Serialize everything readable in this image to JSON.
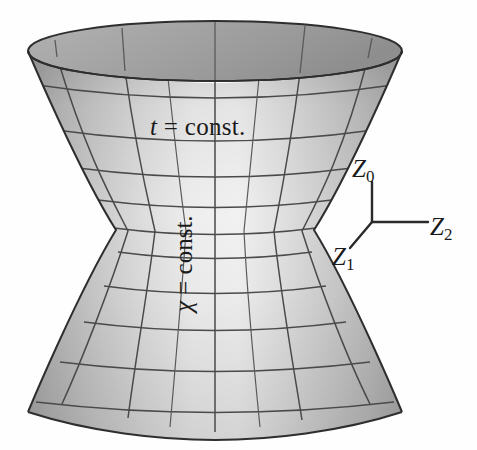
{
  "figure": {
    "kind": "hyperboloid-of-one-sheet",
    "background_color": "#fefefe",
    "outline_color": "#3a3a3a",
    "grid_color": "#4a4a4a",
    "surface_light": "#f0f0f0",
    "surface_mid": "#d2d2d2",
    "surface_dark": "#b4b4b4",
    "rim_interior_color": "#a4a4a4"
  },
  "labels": {
    "t_const": {
      "var": "t",
      "rel": " = const."
    },
    "chi_const": {
      "var": "χ",
      "rel": " = const."
    }
  },
  "axes": {
    "name": "coordinate-triad",
    "origin": {
      "x": 372,
      "y": 222
    },
    "arms": [
      {
        "name": "Z0",
        "letter": "Z",
        "sub": "0",
        "dir": "up",
        "tip": {
          "x": 372,
          "y": 182
        }
      },
      {
        "name": "Z2",
        "letter": "Z",
        "sub": "2",
        "dir": "right",
        "tip": {
          "x": 428,
          "y": 222
        }
      },
      {
        "name": "Z1",
        "letter": "Z",
        "sub": "1",
        "dir": "lower-left",
        "tip": {
          "x": 350,
          "y": 248
        }
      }
    ]
  },
  "geometry": {
    "center_x": 215,
    "waist_y": 230,
    "waist_half_width": 99,
    "top_y": 22,
    "bottom_y": 432,
    "rim_half_width": 187,
    "rim_ellipse_ry": 29,
    "bottom_ellipse_ry": 17,
    "latitude_count": 11,
    "meridian_count": 9
  }
}
